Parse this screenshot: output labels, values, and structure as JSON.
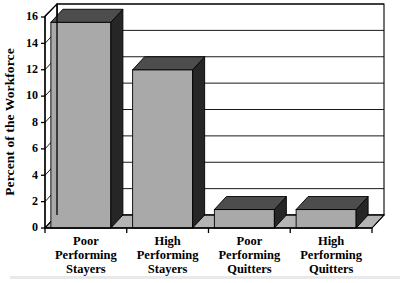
{
  "chart_data": {
    "type": "bar",
    "title": "",
    "subtitle": "",
    "xlabel": "",
    "ylabel": "Percent of the Workforce",
    "categories": [
      "Poor Performing Stayers",
      "High Performing Stayers",
      "Poor Performing Quitters",
      "High Performing Quitters"
    ],
    "category_lines": [
      [
        "Poor",
        "Performing",
        "Stayers"
      ],
      [
        "High",
        "Performing",
        "Stayers"
      ],
      [
        "Poor",
        "Performing",
        "Quitters"
      ],
      [
        "High",
        "Performing",
        "Quitters"
      ]
    ],
    "values": [
      15.6,
      12.0,
      1.4,
      1.4
    ],
    "ylim": [
      0,
      16
    ],
    "ytick_labels": [
      "0",
      "2",
      "4",
      "6",
      "8",
      "10",
      "12",
      "14",
      "16"
    ],
    "ytick_values": [
      0,
      2,
      4,
      6,
      8,
      10,
      12,
      14,
      16
    ],
    "grid": true,
    "legend": "none",
    "style": "3d-column",
    "colors": {
      "bar_front": "#a9a9a9",
      "bar_side": "#262626",
      "bar_top": "#4d4d4d",
      "floor": "#b4b4b4",
      "wall": "#ffffff",
      "axis": "#000000",
      "text": "#000000"
    }
  }
}
